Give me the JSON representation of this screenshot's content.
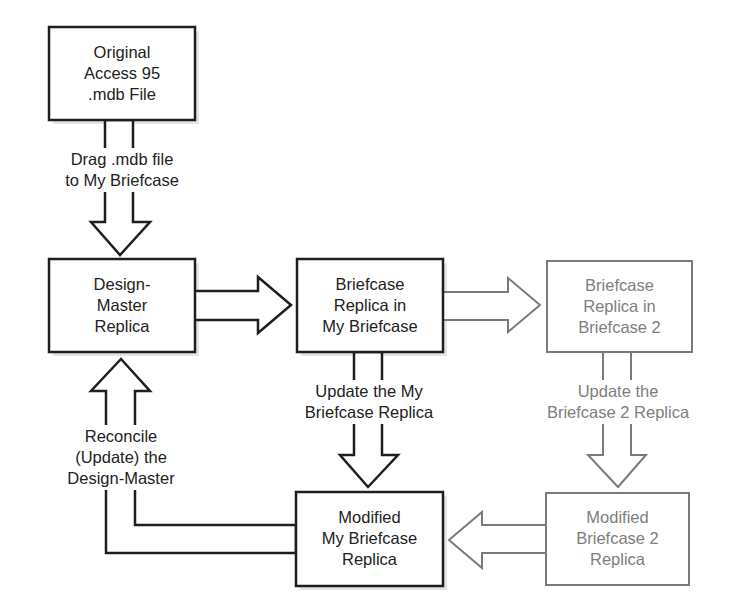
{
  "diagram": {
    "colors": {
      "primary": "#1e1e1e",
      "secondary": "#7a7a7a",
      "text_primary": "#222222",
      "text_secondary": "#7e7e7e",
      "background": "#ffffff"
    },
    "nodes": {
      "original": {
        "lines": [
          "Original",
          "Access 95",
          ".mdb File"
        ],
        "style": "dark"
      },
      "design_master": {
        "lines": [
          "Design-",
          "Master",
          "Replica"
        ],
        "style": "dark"
      },
      "briefcase_replica": {
        "lines": [
          "Briefcase",
          "Replica in",
          "My Briefcase"
        ],
        "style": "dark"
      },
      "briefcase2_replica": {
        "lines": [
          "Briefcase",
          "Replica in",
          "Briefcase 2"
        ],
        "style": "gray"
      },
      "modified_my_briefcase": {
        "lines": [
          "Modified",
          "My Briefcase",
          "Replica"
        ],
        "style": "dark"
      },
      "modified_briefcase2": {
        "lines": [
          "Modified",
          "Briefcase 2",
          "Replica"
        ],
        "style": "gray"
      }
    },
    "edges": {
      "drag": {
        "from": "original",
        "to": "design_master",
        "lines": [
          "Drag .mdb file",
          "to My Briefcase"
        ]
      },
      "dm_to_briefcase": {
        "from": "design_master",
        "to": "briefcase_replica",
        "lines": []
      },
      "briefcase_to_b2": {
        "from": "briefcase_replica",
        "to": "briefcase2_replica",
        "lines": []
      },
      "update_my": {
        "from": "briefcase_replica",
        "to": "modified_my_briefcase",
        "lines": [
          "Update the My",
          "Briefcase Replica"
        ]
      },
      "update_b2": {
        "from": "briefcase2_replica",
        "to": "modified_briefcase2",
        "lines": [
          "Update the",
          "Briefcase 2 Replica"
        ]
      },
      "b2_to_modified_my": {
        "from": "modified_briefcase2",
        "to": "modified_my_briefcase",
        "lines": []
      },
      "reconcile": {
        "from": "modified_my_briefcase",
        "to": "design_master",
        "lines": [
          "Reconcile",
          "(Update) the",
          "Design-Master"
        ]
      }
    }
  }
}
